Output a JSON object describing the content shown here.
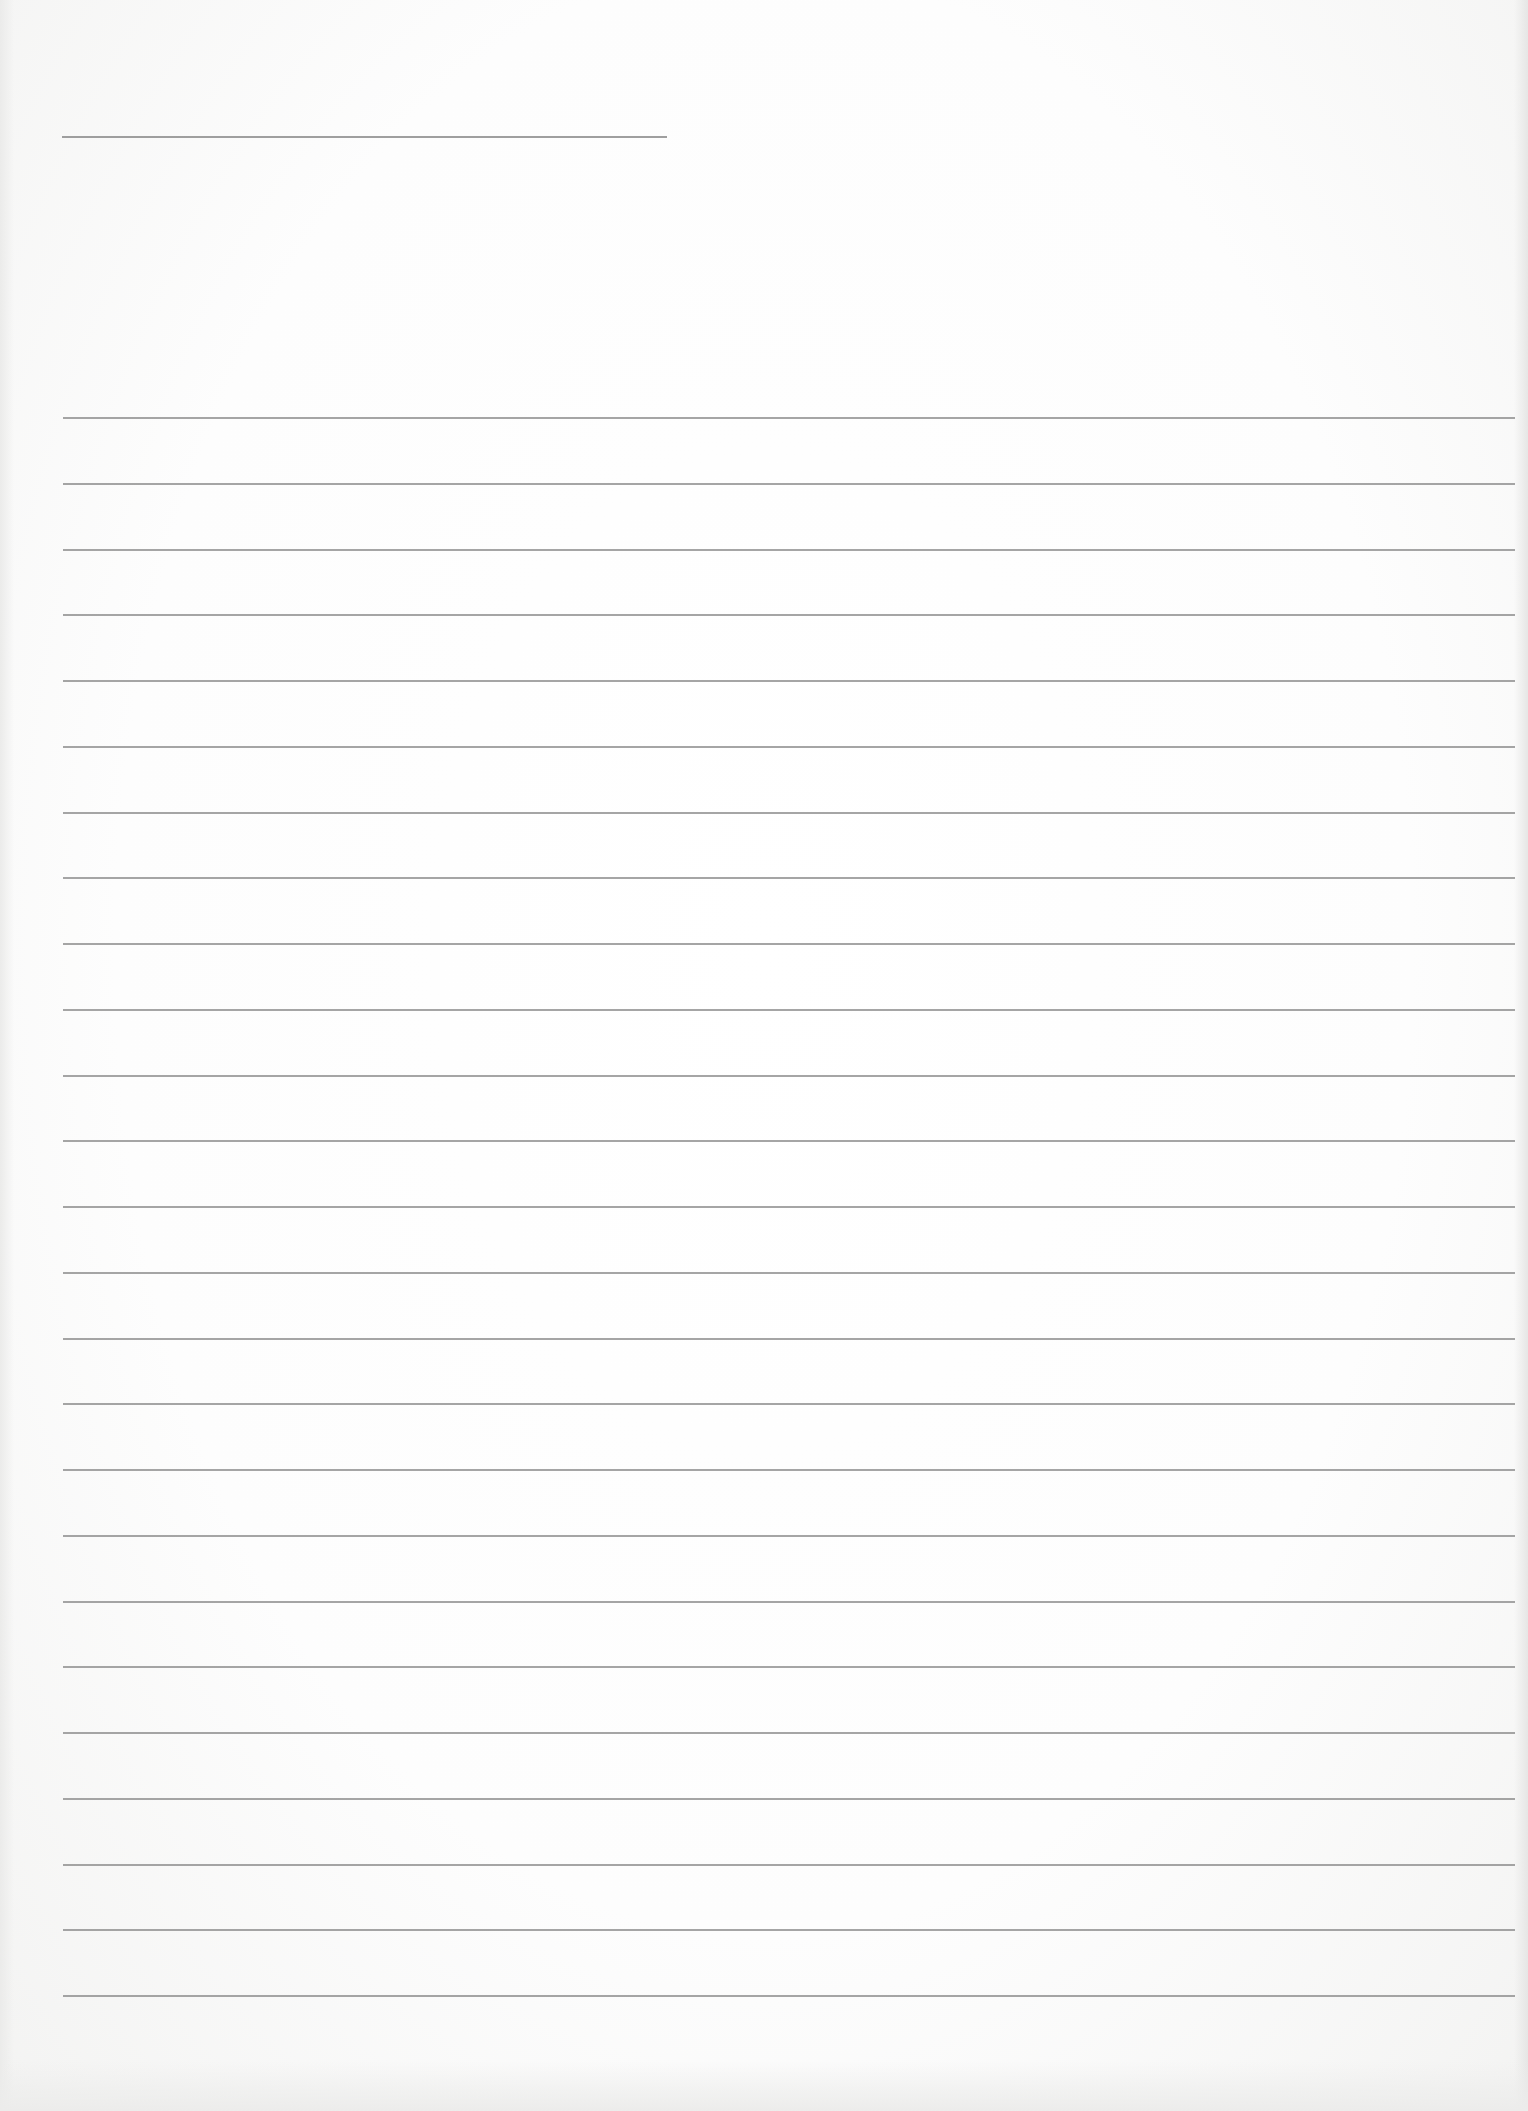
{
  "document": {
    "type": "lined-paper",
    "header_line": {
      "label": ""
    },
    "ruled_lines": {
      "count": 25,
      "first_y": 417,
      "spacing": 65.75,
      "left": 63,
      "width": 1452,
      "color": "#8f8f8f"
    },
    "paper_color": "#ffffff",
    "lines": [
      {
        "text": ""
      },
      {
        "text": ""
      },
      {
        "text": ""
      },
      {
        "text": ""
      },
      {
        "text": ""
      },
      {
        "text": ""
      },
      {
        "text": ""
      },
      {
        "text": ""
      },
      {
        "text": ""
      },
      {
        "text": ""
      },
      {
        "text": ""
      },
      {
        "text": ""
      },
      {
        "text": ""
      },
      {
        "text": ""
      },
      {
        "text": ""
      },
      {
        "text": ""
      },
      {
        "text": ""
      },
      {
        "text": ""
      },
      {
        "text": ""
      },
      {
        "text": ""
      },
      {
        "text": ""
      },
      {
        "text": ""
      },
      {
        "text": ""
      },
      {
        "text": ""
      },
      {
        "text": ""
      }
    ]
  }
}
